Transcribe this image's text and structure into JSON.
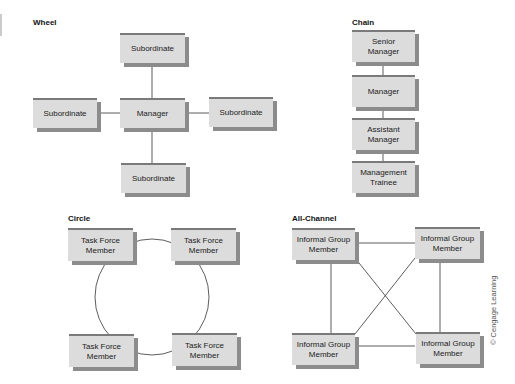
{
  "diagrams": {
    "wheel": {
      "title": "Wheel",
      "nodes": {
        "top": "Subordinate",
        "left": "Subordinate",
        "center": "Manager",
        "right": "Subordinate",
        "bottom": "Subordinate"
      }
    },
    "chain": {
      "title": "Chain",
      "nodes": [
        "Senior\nManager",
        "Manager",
        "Assistant\nManager",
        "Management\nTrainee"
      ]
    },
    "circle": {
      "title": "Circle",
      "nodes": [
        "Task Force\nMember",
        "Task Force\nMember",
        "Task Force\nMember",
        "Task Force\nMember"
      ]
    },
    "all_channel": {
      "title": "All-Channel",
      "nodes": [
        "Informal Group\nMember",
        "Informal Group\nMember",
        "Informal Group\nMember",
        "Informal Group\nMember"
      ]
    }
  },
  "credit": "© Cengage Learning",
  "colors": {
    "box_fill": "#dcdcdc",
    "box_shadow": "#8c8c8c",
    "line": "#333333"
  }
}
